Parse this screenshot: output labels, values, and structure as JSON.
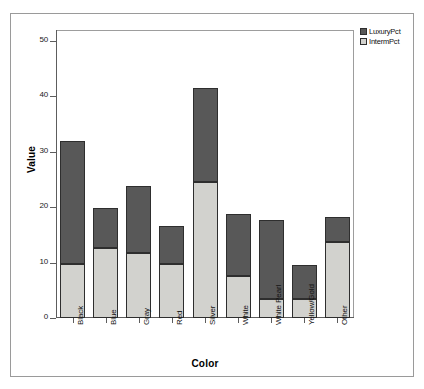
{
  "chart_data": {
    "type": "bar",
    "subtype": "stacked-bar",
    "title": "",
    "xlabel": "Color",
    "ylabel": "Value",
    "ylim": [
      0,
      52
    ],
    "yticks": [
      0,
      10,
      20,
      30,
      40,
      50
    ],
    "ytick_labels": [
      "0",
      "10",
      "20",
      "30",
      "40",
      "50"
    ],
    "grid": false,
    "legend_position": "top-right",
    "categories": [
      "Black",
      "Blue",
      "Gray",
      "Red",
      "Silver",
      "White",
      "White Pearl",
      "Yellow/Gold",
      "Other"
    ],
    "series": [
      {
        "name": "IntermPct",
        "color": "#d2d2ce",
        "values": [
          9.8,
          12.7,
          11.7,
          9.8,
          24.6,
          7.5,
          3.5,
          3.5,
          13.7
        ]
      },
      {
        "name": "LuxuryPct",
        "color": "#585858",
        "values": [
          22.1,
          7.1,
          12.1,
          6.9,
          16.9,
          11.3,
          14.2,
          6.1,
          4.6
        ]
      }
    ],
    "stack_totals": [
      31.9,
      19.8,
      23.8,
      16.7,
      41.5,
      18.8,
      17.7,
      9.6,
      18.3
    ],
    "stack_order": [
      "IntermPct",
      "LuxuryPct"
    ]
  },
  "legend": {
    "entries": [
      {
        "label": "LuxuryPct",
        "color": "#585858"
      },
      {
        "label": "IntermPct",
        "color": "#d2d2ce"
      }
    ]
  },
  "axes": {
    "y_title": "Value",
    "x_title": "Color"
  }
}
